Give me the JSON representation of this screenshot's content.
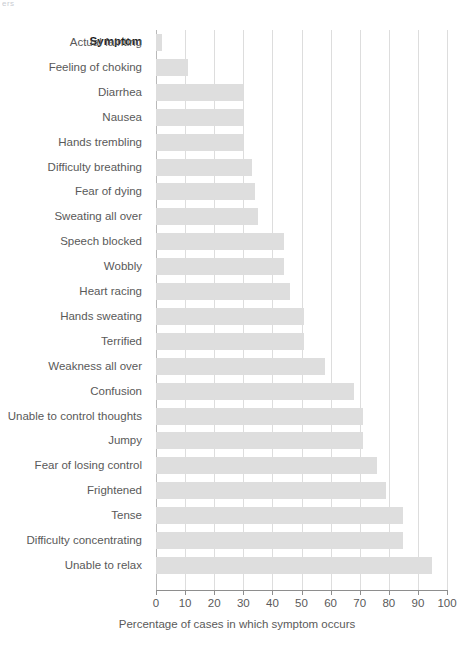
{
  "crop_remnant_text": "ers",
  "chart_data": {
    "type": "bar",
    "orientation": "horizontal",
    "title": "",
    "subtitle": "",
    "xlabel": "Percentage of cases in which symptom occurs",
    "ylabel": "Symptom",
    "category_header": "Symptom",
    "xlim": [
      0,
      100
    ],
    "xticks": [
      0,
      10,
      20,
      30,
      40,
      50,
      60,
      70,
      80,
      90,
      100
    ],
    "xtick_labels": [
      "0",
      "10",
      "20",
      "30",
      "40",
      "50",
      "60",
      "70",
      "80",
      "90",
      "100"
    ],
    "grid": "vertical",
    "legend": "none",
    "bar_color": "#dedede",
    "gridline_color": "#dddddd",
    "axis_color": "#8e8e8e",
    "categories": [
      "Actual fainting",
      "Feeling of choking",
      "Diarrhea",
      "Nausea",
      "Hands trembling",
      "Difficulty breathing",
      "Fear of dying",
      "Sweating all over",
      "Speech blocked",
      "Wobbly",
      "Heart racing",
      "Hands sweating",
      "Terrified",
      "Weakness all over",
      "Confusion",
      "Unable to control thoughts",
      "Jumpy",
      "Fear of losing control",
      "Frightened",
      "Tense",
      "Difficulty concentrating",
      "Unable to relax"
    ],
    "values": [
      2,
      11,
      30,
      30,
      30,
      33,
      34,
      35,
      44,
      44,
      46,
      51,
      51,
      58,
      68,
      71,
      71,
      76,
      79,
      85,
      85,
      95
    ]
  }
}
